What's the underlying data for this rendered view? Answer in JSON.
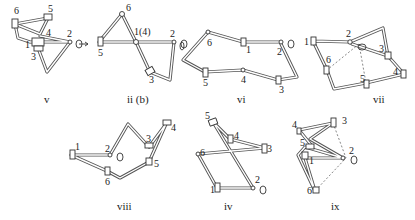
{
  "figure": {
    "panels": [
      {
        "id": "v",
        "caption": "v",
        "joints": {
          "1": [
            30,
            42
          ],
          "2": [
            70,
            42
          ],
          "3": [
            38,
            48
          ],
          "4": [
            44,
            34
          ],
          "5": [
            48,
            20
          ],
          "6": [
            15,
            23
          ]
        }
      },
      {
        "id": "ii_b",
        "caption": "ii (b)",
        "joints": {
          "1(4)": [
            136,
            42
          ],
          "2": [
            172,
            42
          ],
          "3": [
            150,
            72
          ],
          "5": [
            99,
            42
          ],
          "6": [
            122,
            13
          ]
        }
      },
      {
        "id": "vi",
        "caption": "vi",
        "joints": {
          "1": [
            243,
            42
          ],
          "2": [
            280,
            42
          ],
          "3": [
            277,
            80
          ],
          "4": [
            243,
            70
          ],
          "5": [
            205,
            72
          ],
          "6": [
            208,
            32
          ]
        }
      },
      {
        "id": "vii",
        "caption": "vii",
        "joints": {
          "1": [
            313,
            41
          ],
          "2": [
            350,
            42
          ],
          "3": [
            388,
            56
          ],
          "4": [
            404,
            74
          ],
          "5": [
            366,
            83
          ],
          "6": [
            327,
            70
          ]
        }
      },
      {
        "id": "viii",
        "caption": "viii",
        "joints": {
          "1": [
            75,
            155
          ],
          "2": [
            110,
            155
          ],
          "3": [
            149,
            147
          ],
          "4": [
            166,
            124
          ],
          "5": [
            149,
            162
          ],
          "6": [
            107,
            171
          ]
        }
      },
      {
        "id": "iv",
        "caption": "iv",
        "joints": {
          "1": [
            217,
            188
          ],
          "2": [
            253,
            188
          ],
          "3": [
            265,
            148
          ],
          "4": [
            230,
            139
          ],
          "5": [
            213,
            123
          ],
          "6": [
            198,
            154
          ]
        }
      },
      {
        "id": "ix",
        "caption": "ix",
        "joints": {
          "1": [
            305,
            158
          ],
          "2": [
            343,
            158
          ],
          "3": [
            333,
            123
          ],
          "4": [
            299,
            130
          ],
          "5": [
            305,
            147
          ],
          "6": [
            315,
            191
          ]
        }
      }
    ]
  }
}
